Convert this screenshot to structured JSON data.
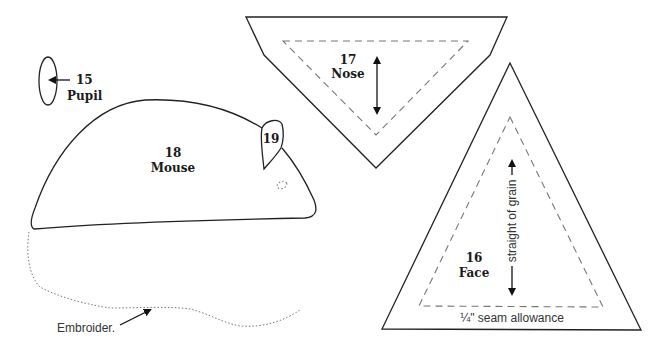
{
  "pieces": {
    "pupil": {
      "number": "15",
      "name": "Pupil"
    },
    "face": {
      "number": "16",
      "name": "Face",
      "grain_label": "straight of grain",
      "seam_label": "¼\" seam allowance"
    },
    "nose": {
      "number": "17",
      "name": "Nose"
    },
    "mouse": {
      "number": "18",
      "name": "Mouse"
    },
    "ear": {
      "number": "19"
    }
  },
  "annotations": {
    "embroider": "Embroider."
  },
  "colors": {
    "cut_line": "#222222",
    "seam_line": "#777777",
    "background": "#ffffff"
  }
}
